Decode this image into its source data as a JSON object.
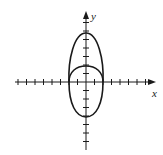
{
  "diagram": {
    "type": "polar-curve-plot",
    "axes": {
      "x_label": "x",
      "y_label": "y",
      "origin_px": [
        86,
        82
      ],
      "tick_spacing_px": 8.5,
      "x_ticks_left": 8,
      "x_ticks_right": 7,
      "y_ticks_up": 7,
      "y_ticks_down": 7
    },
    "curves": [
      {
        "name": "outer-curve",
        "description": "Tall closed oval, extends 6 units up, 4 units down, 2 units left/right at x-axis"
      },
      {
        "name": "inner-arch",
        "description": "Upper half circle of radius 2 centered at origin"
      }
    ],
    "colors": {
      "stroke": "#1a1a1a",
      "background": "#ffffff"
    }
  }
}
